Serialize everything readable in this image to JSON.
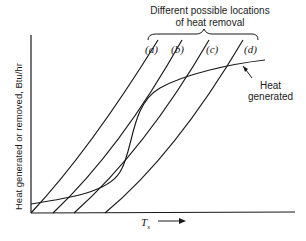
{
  "title": {
    "line1": "Different possible locations",
    "line2": "of heat removal"
  },
  "curve_labels": {
    "a": "(a)",
    "b": "(b)",
    "c": "(c)",
    "d": "(d)"
  },
  "annotation": {
    "line1": "Heat",
    "line2": "generated"
  },
  "axes": {
    "ylabel": "Heat generated or removed, Btu/hr",
    "xlabel_main": "T",
    "xlabel_sub": "s"
  },
  "colors": {
    "line": "#1a1a1a",
    "background": "#ffffff"
  }
}
